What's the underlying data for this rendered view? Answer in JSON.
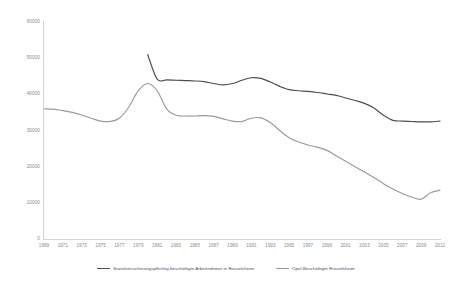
{
  "chart_data": {
    "type": "line",
    "title": "",
    "xlabel": "",
    "ylabel": "",
    "ylim": [
      0,
      60000
    ],
    "ytick_values": [
      0,
      10000,
      20000,
      30000,
      40000,
      50000,
      60000
    ],
    "ytick_labels": [
      "0",
      "10000",
      "20000",
      "30000",
      "40000",
      "50000",
      "60000"
    ],
    "grid": false,
    "legend_position": "bottom",
    "x": [
      1969,
      1970,
      1971,
      1972,
      1973,
      1974,
      1975,
      1976,
      1977,
      1978,
      1979,
      1980,
      1981,
      1982,
      1983,
      1984,
      1985,
      1986,
      1987,
      1988,
      1989,
      1990,
      1991,
      1992,
      1993,
      1994,
      1995,
      1996,
      1997,
      1998,
      1999,
      2000,
      2001,
      2002,
      2003,
      2004,
      2005,
      2006,
      2007,
      2008,
      2009,
      2010,
      2011
    ],
    "xtick_labels": [
      "1969",
      "1971",
      "1973",
      "1975",
      "1977",
      "1979",
      "1981",
      "1983",
      "1985",
      "1987",
      "1989",
      "1991",
      "1993",
      "1995",
      "1997",
      "1999",
      "2001",
      "2003",
      "2005",
      "2007",
      "2009",
      "2011"
    ],
    "series": [
      {
        "name": "Sozialversicherungspflichtig beschäftigte Arbeitnehmer in Rüsselsheim",
        "color": "#4d4d4d",
        "values": [
          null,
          null,
          null,
          null,
          null,
          null,
          null,
          null,
          null,
          null,
          null,
          51000,
          44200,
          44000,
          43900,
          43800,
          43700,
          43500,
          43000,
          42600,
          43000,
          43900,
          44600,
          44400,
          43400,
          42200,
          41300,
          41000,
          40800,
          40500,
          40100,
          39700,
          39000,
          38300,
          37500,
          36200,
          34200,
          32800,
          32600,
          32500,
          32400,
          32400,
          32600
        ]
      },
      {
        "name": "Opel-Beschäftigte Rüsselsheim",
        "color": "#9a9a9a",
        "values": [
          36000,
          35900,
          35500,
          35000,
          34300,
          33400,
          32600,
          32500,
          33400,
          36500,
          41000,
          43000,
          41000,
          36000,
          34200,
          34000,
          34000,
          34100,
          33900,
          33200,
          32600,
          32500,
          33400,
          33500,
          32200,
          30000,
          28000,
          26800,
          26000,
          25400,
          24500,
          23000,
          21500,
          20000,
          18500,
          17000,
          15300,
          13800,
          12600,
          11600,
          11000,
          12800,
          13500
        ]
      }
    ]
  },
  "legend": {
    "items": [
      {
        "label": "Sozialversicherungspflichtig beschäftigte Arbeitnehmer in Rüsselsheim",
        "color": "#4d4d4d"
      },
      {
        "label": "Opel-Beschäftigte Rüsselsheim",
        "color": "#9a9a9a"
      }
    ]
  }
}
